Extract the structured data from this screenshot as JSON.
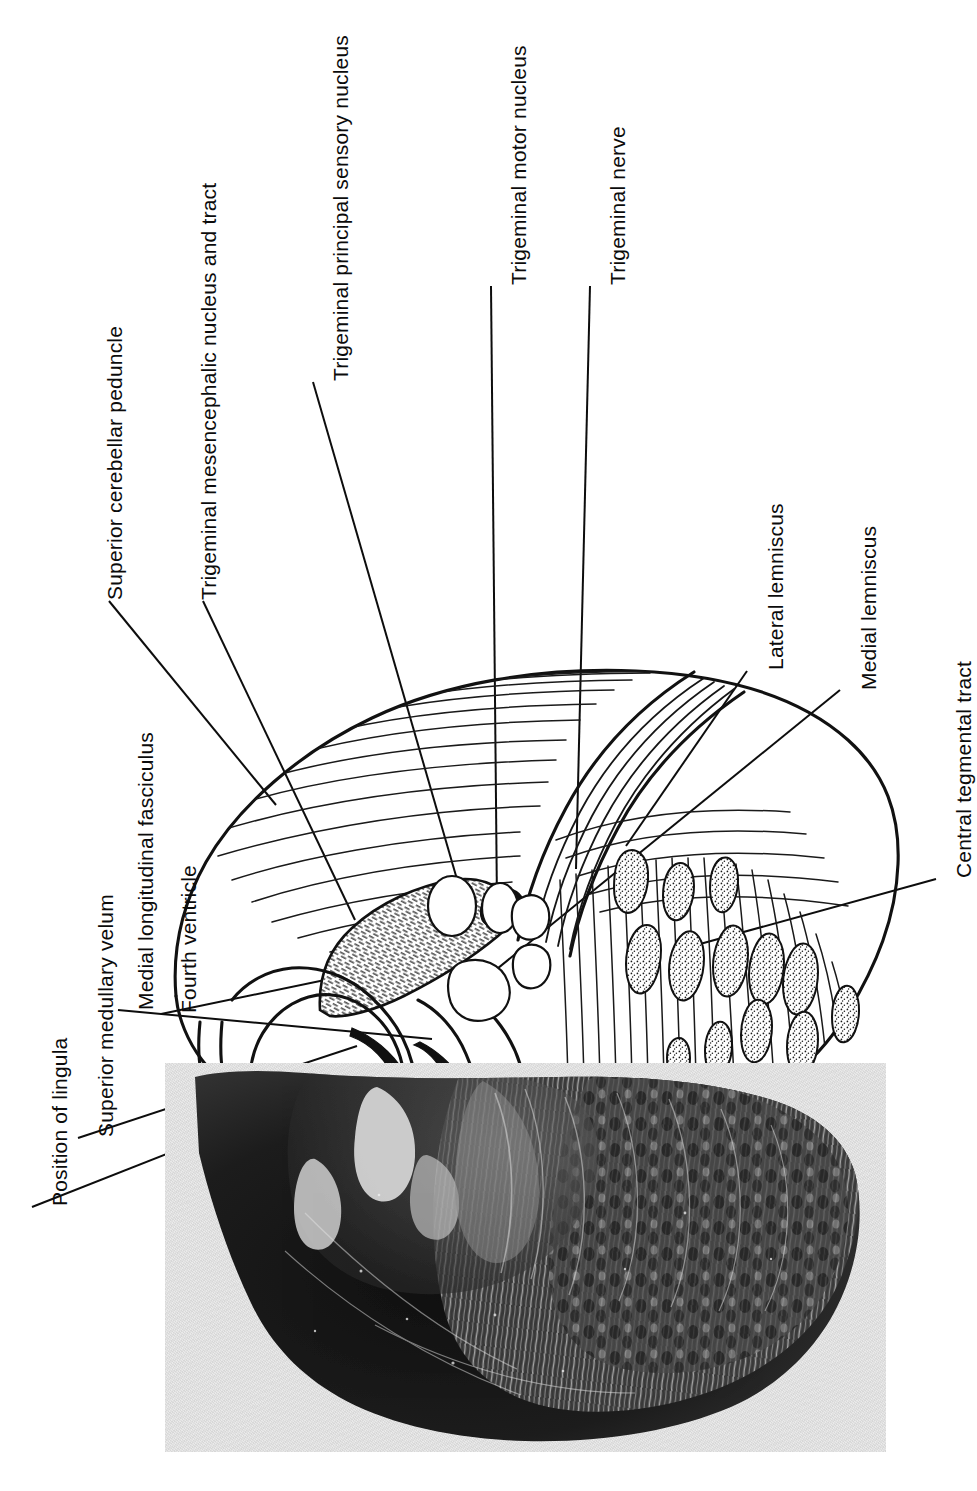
{
  "figure": {
    "kind": "anatomical-plate",
    "orientation_note": "All labels are set vertically, rotated 90 degrees counter-clockwise",
    "background_color": "#ffffff",
    "ink_color": "#111111",
    "photo_tone": "#e9e9e9"
  },
  "labels": [
    {
      "id": "superior-cerebellar-peduncle",
      "text": "Superior cerebellar peduncle",
      "column": "left-upper"
    },
    {
      "id": "trigeminal-mesencephalic-nucleus-and-tract",
      "text": "Trigeminal mesencephalic nucleus and tract",
      "column": "left-upper"
    },
    {
      "id": "trigeminal-principal-sensory-nucleus",
      "text": "Trigeminal principal sensory nucleus",
      "column": "centre-upper"
    },
    {
      "id": "trigeminal-motor-nucleus",
      "text": "Trigeminal motor nucleus",
      "column": "centre-upper"
    },
    {
      "id": "trigeminal-nerve",
      "text": "Trigeminal nerve",
      "column": "centre-upper"
    },
    {
      "id": "lateral-lemniscus",
      "text": "Lateral lemniscus",
      "column": "right"
    },
    {
      "id": "medial-lemniscus",
      "text": "Medial lemniscus",
      "column": "right"
    },
    {
      "id": "central-tegmental-tract",
      "text": "Central tegmental tract",
      "column": "right"
    },
    {
      "id": "fourth-ventricle",
      "text": "Fourth ventricle",
      "column": "left-lower"
    },
    {
      "id": "medial-longitudinal-fasciculus",
      "text": "Medial longitudinal fasciculus",
      "column": "left-lower"
    },
    {
      "id": "superior-medullary-velum",
      "text": "Superior medullary velum",
      "column": "left-lower"
    },
    {
      "id": "position-of-lingula",
      "text": "Position of lingula",
      "column": "left-lower"
    }
  ],
  "panels": {
    "line_drawing": {
      "name": "Schematic line drawing of the pons",
      "position": "upper two thirds"
    },
    "photomicrograph": {
      "name": "Myelin-stained histological section",
      "position": "lower third"
    }
  }
}
